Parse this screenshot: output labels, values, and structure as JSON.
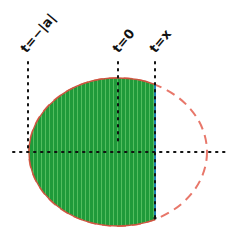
{
  "diagram": {
    "labels": {
      "t_neg_abs_a": "t=−|a|",
      "t_zero": "t=0",
      "t_x": "t=x"
    },
    "colors": {
      "fill": "#1f9a3a",
      "stripe": "#52bd5e",
      "ellipse_outline": "#e8776a",
      "cut_edge": "#1c7fb0",
      "dotted": "#111111"
    },
    "geometry": {
      "ellipse_center": [
        118,
        152
      ],
      "ellipse_rx": 89,
      "ellipse_ry": 74,
      "axis_y": 152,
      "x_left": 29,
      "x_zero": 118,
      "x_cut": 155
    }
  }
}
